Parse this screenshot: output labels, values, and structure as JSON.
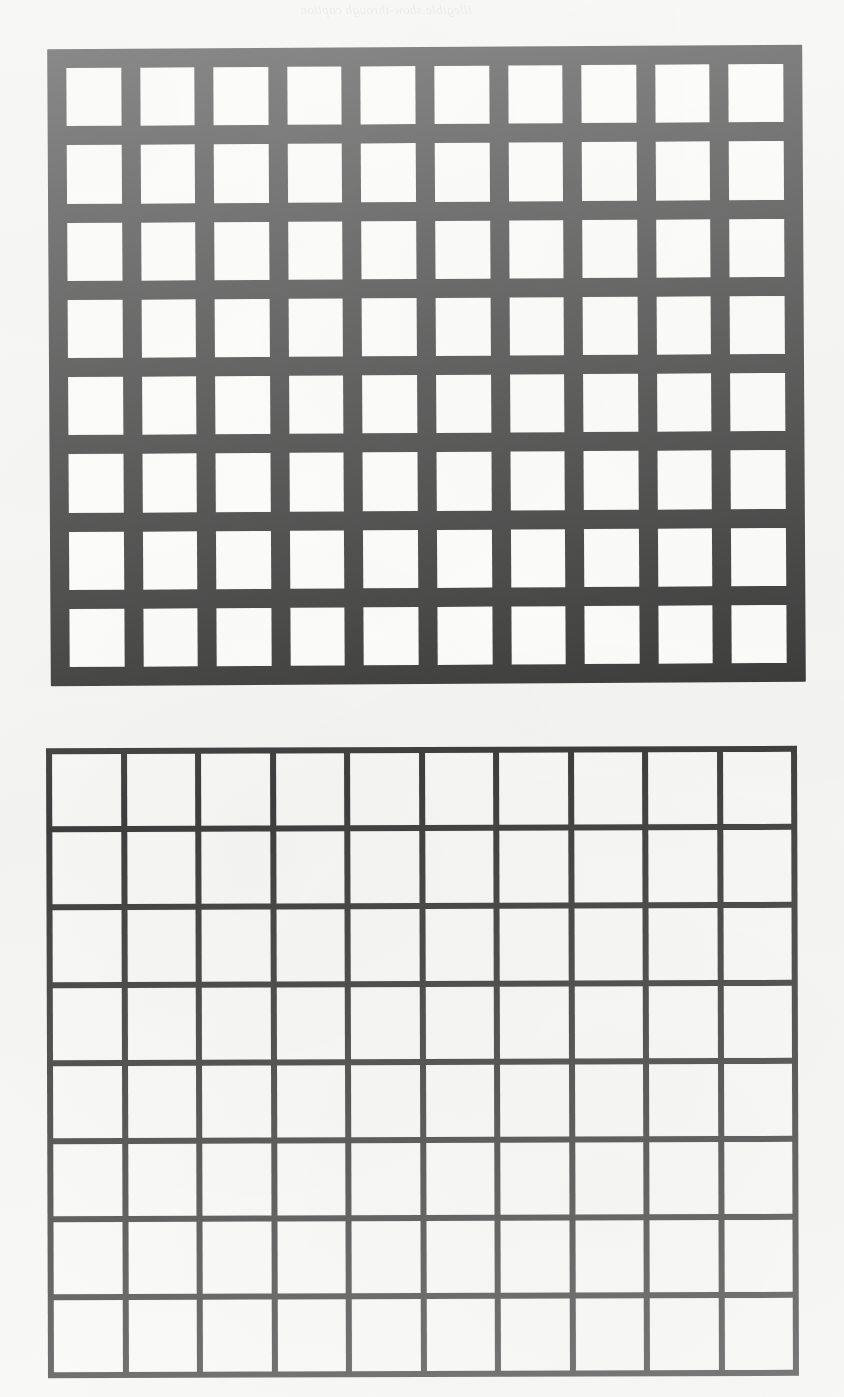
{
  "page": {
    "kind": "scanned-book-page",
    "width": 844,
    "height": 1397,
    "paper_color": "#f4f4f2",
    "ink_color": "#111010",
    "cell_color": "#f7f7f5"
  },
  "bleed_through": {
    "note": "Faint mirrored show-through text from the reverse side of the scanned sheet; largely illegible.",
    "top_caption": "illegible show-through caption",
    "lower_lines": [
      "illegible show-through line",
      "illegible show-through line",
      "illegible show-through line",
      "illegible show-through line",
      "illegible show-through line",
      "illegible show-through line",
      "illegible show-through line",
      "illegible show-through line",
      "illegible show-through line",
      "illegible show-through line",
      "illegible show-through line",
      "illegible show-through line"
    ]
  },
  "figures": [
    {
      "id": "figure-top",
      "name": "thick-rule-grid",
      "columns": 10,
      "rows": 8,
      "cells_total": 80,
      "line_weight_px": 19,
      "cell_size_px": 56,
      "pitch_px": 75,
      "line_color": "#111010",
      "cell_color": "#f7f7f5",
      "rotation_deg": -0.33
    },
    {
      "id": "figure-bottom",
      "name": "thin-rule-grid",
      "columns": 10,
      "rows": 8,
      "cells_total": 80,
      "line_weight_px": 6,
      "cell_size_px": 69,
      "pitch_px": 75,
      "line_color": "#111010",
      "cell_color": "#f7f7f5",
      "rotation_deg": -0.18
    }
  ],
  "chart_data": {
    "type": "heatmap",
    "title": "",
    "xlabel": "",
    "ylabel": "",
    "grid": true,
    "legend_position": "none",
    "panels": [
      {
        "name": "thick-rule-grid",
        "columns": 10,
        "rows": 8,
        "values": [
          [
            0,
            0,
            0,
            0,
            0,
            0,
            0,
            0,
            0,
            0
          ],
          [
            0,
            0,
            0,
            0,
            0,
            0,
            0,
            0,
            0,
            0
          ],
          [
            0,
            0,
            0,
            0,
            0,
            0,
            0,
            0,
            0,
            0
          ],
          [
            0,
            0,
            0,
            0,
            0,
            0,
            0,
            0,
            0,
            0
          ],
          [
            0,
            0,
            0,
            0,
            0,
            0,
            0,
            0,
            0,
            0
          ],
          [
            0,
            0,
            0,
            0,
            0,
            0,
            0,
            0,
            0,
            0
          ],
          [
            0,
            0,
            0,
            0,
            0,
            0,
            0,
            0,
            0,
            0
          ],
          [
            0,
            0,
            0,
            0,
            0,
            0,
            0,
            0,
            0,
            0
          ]
        ]
      },
      {
        "name": "thin-rule-grid",
        "columns": 10,
        "rows": 8,
        "values": [
          [
            0,
            0,
            0,
            0,
            0,
            0,
            0,
            0,
            0,
            0
          ],
          [
            0,
            0,
            0,
            0,
            0,
            0,
            0,
            0,
            0,
            0
          ],
          [
            0,
            0,
            0,
            0,
            0,
            0,
            0,
            0,
            0,
            0
          ],
          [
            0,
            0,
            0,
            0,
            0,
            0,
            0,
            0,
            0,
            0
          ],
          [
            0,
            0,
            0,
            0,
            0,
            0,
            0,
            0,
            0,
            0
          ],
          [
            0,
            0,
            0,
            0,
            0,
            0,
            0,
            0,
            0,
            0
          ],
          [
            0,
            0,
            0,
            0,
            0,
            0,
            0,
            0,
            0,
            0
          ],
          [
            0,
            0,
            0,
            0,
            0,
            0,
            0,
            0,
            0,
            0
          ]
        ]
      }
    ]
  }
}
